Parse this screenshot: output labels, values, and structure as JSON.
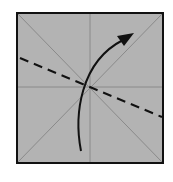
{
  "diagram": {
    "type": "origami-fold-step",
    "paper": {
      "x": 17,
      "y": 13,
      "width": 146,
      "height": 150,
      "fill": "#b3b3b3",
      "border_color": "#111111",
      "border_width": 2
    },
    "creases": {
      "color": "#8a8a8a",
      "lines": [
        {
          "name": "diagonal-tl-br",
          "x1": 18,
          "y1": 14,
          "x2": 162,
          "y2": 162
        },
        {
          "name": "diagonal-bl-tr",
          "x1": 18,
          "y1": 162,
          "x2": 162,
          "y2": 14
        },
        {
          "name": "vertical-center",
          "x1": 90,
          "y1": 14,
          "x2": 90,
          "y2": 162
        },
        {
          "name": "horizontal-center",
          "x1": 18,
          "y1": 87,
          "x2": 162,
          "y2": 87
        }
      ]
    },
    "valley_fold_line": {
      "x1": 20,
      "y1": 58,
      "x2": 162,
      "y2": 117,
      "color": "#111111",
      "dash": "9,6"
    },
    "fold_arrow": {
      "path": "M 81 151 C 74 115, 80 62, 123 40",
      "color": "#111111",
      "head_points": "134,33 117,36 124,46"
    }
  }
}
